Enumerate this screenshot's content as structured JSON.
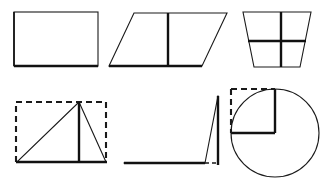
{
  "canvas": {
    "width": 328,
    "height": 179,
    "background": "#ffffff",
    "stroke_color": "#1a1a1a",
    "title": "Geometry figures: area of quadrilaterals and triangles"
  },
  "figures": [
    {
      "id": "rectangle",
      "name": "Rectangle",
      "row": "top",
      "column": "left",
      "description": "Plain rectangle with a bold base edge",
      "geometry": {
        "x": 14,
        "y": 12,
        "width": 84,
        "height": 54,
        "bold_edges": [
          "bottom",
          "left"
        ]
      }
    },
    {
      "id": "parallelogram",
      "name": "Parallelogram with height",
      "row": "top",
      "column": "center",
      "description": "Slanted parallelogram with a vertical height segment drawn inside",
      "geometry": {
        "points": "109,66 134,13 227,13 202,66",
        "height_segment": "168,13 168,66",
        "bold_edges": [
          "bottom",
          "height"
        ]
      }
    },
    {
      "id": "trapezoid",
      "name": "Trapezoid divided into four parts",
      "row": "top",
      "column": "right",
      "description": "Inverted trapezoid, wider at the top, split by one vertical and one horizontal bold line",
      "geometry": {
        "points": "243,12 311,12 300,67 254,67",
        "vertical_divider": "281,12 281,67",
        "horizontal_divider": "248,41 306,41"
      }
    },
    {
      "id": "triangle-in-rectangle",
      "name": "Triangle inscribed in dashed rectangle",
      "row": "bottom",
      "column": "left",
      "description": "Acute triangle inside a dashed rectangle with the altitude drawn from the apex",
      "geometry": {
        "dashed_rect": {
          "x": 16,
          "y": 102,
          "width": 90,
          "height": 60
        },
        "triangle": "17,162 79,102 106,162",
        "altitude": "79,102 79,162"
      }
    },
    {
      "id": "obtuse-triangle",
      "name": "Obtuse triangle with external height",
      "row": "bottom",
      "column": "center",
      "description": "Obtuse triangle whose altitude falls outside the base, with the base extended by a dashed segment",
      "geometry": {
        "triangle": "124,163 205,163 218,96",
        "altitude": "218,96 218,165",
        "base_extension_dashed": "205,163 218,163"
      }
    },
    {
      "id": "circle-with-square",
      "name": "Circle with inscribed radius square",
      "row": "bottom",
      "column": "right",
      "description": "Circle with two solid radii forming a right angle and a dashed square completing the quadrant",
      "geometry": {
        "circle": {
          "cx": 275,
          "cy": 133,
          "r": 44
        },
        "vertical_radius": "275,89 275,133",
        "horizontal_radius": "275,133 231,133",
        "dashed_top": "231,89 275,89",
        "dashed_left": "231,89 231,133"
      }
    }
  ]
}
